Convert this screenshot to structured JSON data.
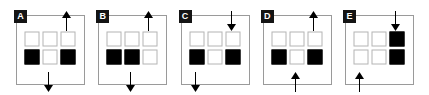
{
  "figure": {
    "type": "multiple-choice-panels",
    "panel_count": 5,
    "grid": {
      "rows": 2,
      "cols": 3
    },
    "legend": {
      "filled": "black square",
      "empty": "white square",
      "arrow_up": "arrow pointing up",
      "arrow_down": "arrow pointing down"
    },
    "colors": {
      "filled": "#000000",
      "empty_fill": "#ffffff",
      "empty_border": "#b4b4b4",
      "panel_border": "#9a9a9a",
      "badge_bg": "#141414",
      "badge_text": "#ffffff",
      "background": "#ffffff",
      "arrow": "#000000"
    },
    "panels": [
      {
        "label": "A",
        "cells": [
          [
            "empty",
            "empty",
            "empty"
          ],
          [
            "filled",
            "empty",
            "filled"
          ]
        ],
        "arrows": [
          {
            "position": "top",
            "column": "right",
            "direction": "up"
          },
          {
            "position": "bottom",
            "column": "mid",
            "direction": "down"
          }
        ]
      },
      {
        "label": "B",
        "cells": [
          [
            "empty",
            "empty",
            "empty"
          ],
          [
            "filled",
            "filled",
            "empty"
          ]
        ],
        "arrows": [
          {
            "position": "top",
            "column": "right",
            "direction": "up"
          },
          {
            "position": "bottom",
            "column": "mid",
            "direction": "down"
          }
        ]
      },
      {
        "label": "C",
        "cells": [
          [
            "empty",
            "empty",
            "empty"
          ],
          [
            "filled",
            "empty",
            "filled"
          ]
        ],
        "arrows": [
          {
            "position": "top",
            "column": "right",
            "direction": "down"
          },
          {
            "position": "bottom",
            "column": "left",
            "direction": "down"
          }
        ]
      },
      {
        "label": "D",
        "cells": [
          [
            "empty",
            "empty",
            "empty"
          ],
          [
            "filled",
            "empty",
            "filled"
          ]
        ],
        "arrows": [
          {
            "position": "top",
            "column": "right",
            "direction": "up"
          },
          {
            "position": "bottom",
            "column": "mid",
            "direction": "up"
          }
        ]
      },
      {
        "label": "E",
        "cells": [
          [
            "empty",
            "empty",
            "filled"
          ],
          [
            "empty",
            "empty",
            "filled"
          ]
        ],
        "arrows": [
          {
            "position": "top",
            "column": "right",
            "direction": "down"
          },
          {
            "position": "bottom",
            "column": "left",
            "direction": "up"
          }
        ]
      }
    ]
  }
}
